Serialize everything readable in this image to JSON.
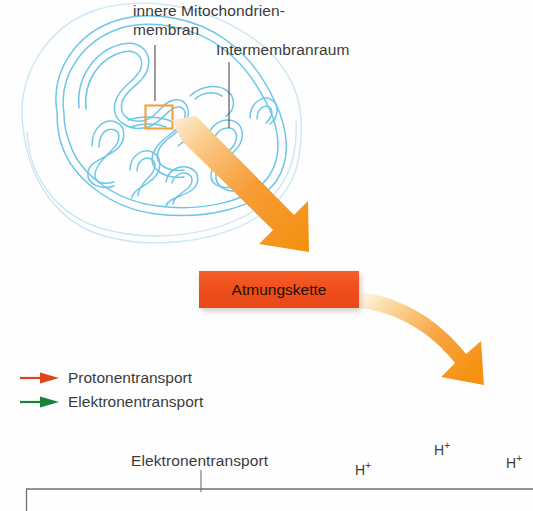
{
  "figure": {
    "width": 533,
    "height": 511,
    "background_color": "#fefefe"
  },
  "labels": {
    "inner_membrane": "innere Mitochondrien-\nmembran",
    "inner_membrane_line1": "innere Mitochondrien-",
    "inner_membrane_line2": "membran",
    "intermembrane_space": "Intermembranraum",
    "electron_transport_axis": "Elektronentransport"
  },
  "respiratory_chain": {
    "label": "Atmungskette",
    "fill_color": "#ee4d18",
    "text_color": "#231008"
  },
  "legend": {
    "items": [
      {
        "label": "Protonentransport",
        "color": "#e0431a",
        "icon": "arrow-right-icon"
      },
      {
        "label": "Elektronentransport",
        "color": "#18813a",
        "icon": "arrow-right-icon"
      }
    ]
  },
  "ions": [
    {
      "label": "H",
      "charge": "+"
    },
    {
      "label": "H",
      "charge": "+"
    },
    {
      "label": "H",
      "charge": "+"
    }
  ],
  "colors": {
    "membrane_outline": "#6ec6e8",
    "membrane_outer_pale": "#cfe8f5",
    "highlight_box": "#f2a03c",
    "callout_line": "#555555",
    "flow_arrow": "#f79a34",
    "baseline": "#6f6f6f"
  },
  "diagram": {
    "mitochondrion_alt": "Querschnitt eines Mitochondriums mit Cristae",
    "highlight_alt": "orangefarbener Markierungsrahmen an der inneren Membran",
    "arrow_1_alt": "gerader Pfeil von der Markierung zur Atmungskette",
    "arrow_2_alt": "gebogener Pfeil von der Atmungskette nach unten rechts"
  }
}
